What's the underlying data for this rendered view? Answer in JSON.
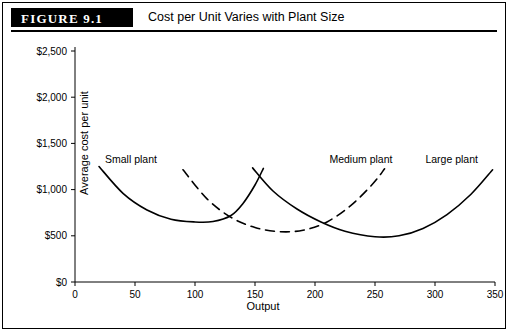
{
  "figure": {
    "badge": "FIGURE 9.1",
    "title": "Cost per Unit Varies with Plant Size"
  },
  "chart_data": {
    "type": "line",
    "title": "Cost per Unit Varies with Plant Size",
    "xlabel": "Output",
    "ylabel": "Average cost per unit",
    "xlim": [
      0,
      350
    ],
    "ylim": [
      0,
      2500
    ],
    "xticks": [
      0,
      50,
      100,
      150,
      200,
      250,
      300,
      350
    ],
    "yticks": [
      "$0",
      "$500",
      "$1,000",
      "$1,500",
      "$2,000",
      "$2,500"
    ],
    "ytick_values": [
      0,
      500,
      1000,
      1500,
      2000,
      2500
    ],
    "grid": false,
    "legend": "none",
    "series": [
      {
        "name": "Small plant",
        "style": "solid",
        "label": "Small plant",
        "label_x": 25,
        "label_y": 1290,
        "points": [
          {
            "x": 20,
            "y": 1250
          },
          {
            "x": 40,
            "y": 960
          },
          {
            "x": 60,
            "y": 780
          },
          {
            "x": 80,
            "y": 680
          },
          {
            "x": 100,
            "y": 650
          },
          {
            "x": 115,
            "y": 655
          },
          {
            "x": 130,
            "y": 720
          },
          {
            "x": 140,
            "y": 850
          },
          {
            "x": 150,
            "y": 1050
          },
          {
            "x": 157,
            "y": 1230
          }
        ]
      },
      {
        "name": "Medium plant",
        "style": "dashed",
        "label": "Medium plant",
        "label_x": 212,
        "label_y": 1290,
        "points": [
          {
            "x": 90,
            "y": 1215
          },
          {
            "x": 110,
            "y": 900
          },
          {
            "x": 130,
            "y": 700
          },
          {
            "x": 150,
            "y": 590
          },
          {
            "x": 170,
            "y": 545
          },
          {
            "x": 190,
            "y": 560
          },
          {
            "x": 210,
            "y": 650
          },
          {
            "x": 230,
            "y": 830
          },
          {
            "x": 248,
            "y": 1060
          },
          {
            "x": 258,
            "y": 1225
          }
        ]
      },
      {
        "name": "Large plant",
        "style": "solid",
        "label": "Large plant",
        "label_x": 292,
        "label_y": 1290,
        "points": [
          {
            "x": 148,
            "y": 1235
          },
          {
            "x": 165,
            "y": 985
          },
          {
            "x": 185,
            "y": 790
          },
          {
            "x": 205,
            "y": 650
          },
          {
            "x": 225,
            "y": 550
          },
          {
            "x": 250,
            "y": 490
          },
          {
            "x": 270,
            "y": 500
          },
          {
            "x": 290,
            "y": 580
          },
          {
            "x": 310,
            "y": 730
          },
          {
            "x": 330,
            "y": 950
          },
          {
            "x": 348,
            "y": 1215
          }
        ]
      }
    ]
  }
}
